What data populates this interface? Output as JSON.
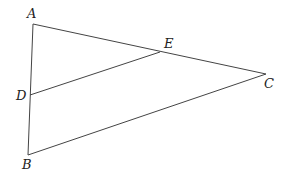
{
  "diagram": {
    "points": {
      "A": {
        "label": "A",
        "x": 33,
        "y": 24
      },
      "B": {
        "label": "B",
        "x": 28,
        "y": 155
      },
      "C": {
        "label": "C",
        "x": 266,
        "y": 74
      },
      "D": {
        "label": "D",
        "x": 30,
        "y": 95
      },
      "E": {
        "label": "E",
        "x": 160,
        "y": 52
      }
    },
    "segments": [
      [
        "A",
        "B"
      ],
      [
        "A",
        "C"
      ],
      [
        "B",
        "C"
      ],
      [
        "D",
        "E"
      ]
    ],
    "line_color": "#444444"
  }
}
